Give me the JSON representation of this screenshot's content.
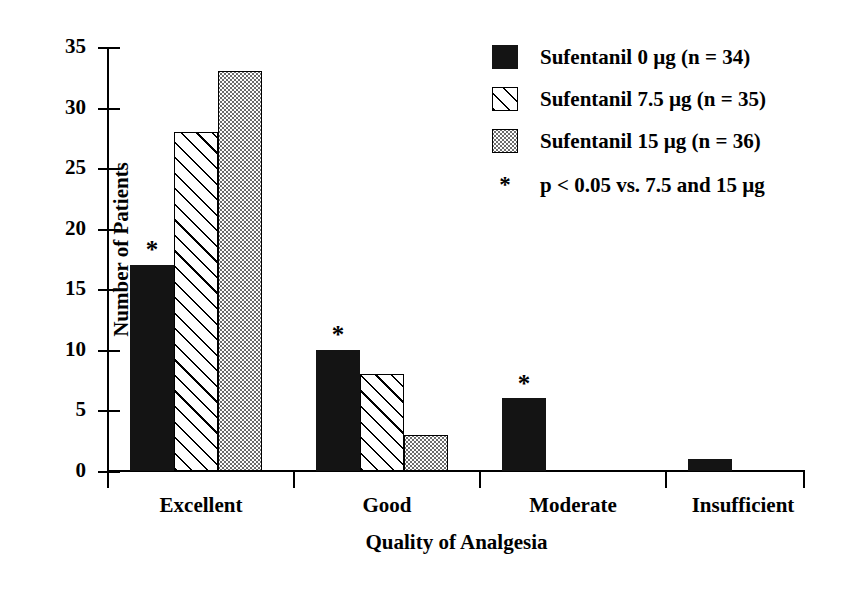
{
  "chart_data": {
    "type": "bar",
    "title": "",
    "xlabel": "Quality of Analgesia",
    "ylabel": "Number of Patients",
    "categories": [
      "Excellent",
      "Good",
      "Moderate",
      "Insufficient"
    ],
    "ylim": [
      0,
      35
    ],
    "yticks": [
      0,
      5,
      10,
      15,
      20,
      25,
      30,
      35
    ],
    "ytick_labels": [
      "0",
      "5",
      "10",
      "15",
      "20",
      "25",
      "30",
      "35"
    ],
    "grid": false,
    "legend_position": "top-right",
    "series": [
      {
        "name": "Sufentanil 0 µg (n = 34)",
        "pattern": "solid",
        "values": [
          17,
          10,
          6,
          1
        ],
        "significance": [
          true,
          true,
          true,
          false
        ]
      },
      {
        "name": "Sufentanil 7.5 µg (n = 35)",
        "pattern": "hatch",
        "values": [
          28,
          8,
          0,
          0
        ],
        "significance": [
          false,
          false,
          false,
          false
        ]
      },
      {
        "name": "Sufentanil 15 µg (n = 36)",
        "pattern": "dots",
        "values": [
          33,
          3,
          0,
          0
        ],
        "significance": [
          false,
          false,
          false,
          false
        ]
      }
    ],
    "annotations": [
      {
        "symbol": "*",
        "text": "p < 0.05 vs. 7.5 and 15 µg"
      }
    ]
  },
  "axes": {
    "y_title": "Number of Patients",
    "x_title": "Quality of Analgesia",
    "y_tick_labels": [
      "35",
      "30",
      "25",
      "20",
      "15",
      "10",
      "5",
      "0"
    ],
    "x_tick_labels": [
      "Excellent",
      "Good",
      "Moderate",
      "Insufficient"
    ]
  },
  "legend": {
    "entries": [
      {
        "label": "Sufentanil 0 µg (n = 34)",
        "pattern": "solid"
      },
      {
        "label": "Sufentanil 7.5 µg (n = 35)",
        "pattern": "hatch"
      },
      {
        "label": "Sufentanil 15 µg (n = 36)",
        "pattern": "dots"
      }
    ],
    "note_symbol": "*",
    "note_text": "p < 0.05 vs. 7.5 and 15 µg"
  },
  "markers": {
    "star": "*"
  },
  "colors": {
    "ink": "#000000",
    "background": "#ffffff",
    "series_solid": "#141414",
    "series_hatch": "#ffffff",
    "series_dots": "#d9d9d9"
  }
}
